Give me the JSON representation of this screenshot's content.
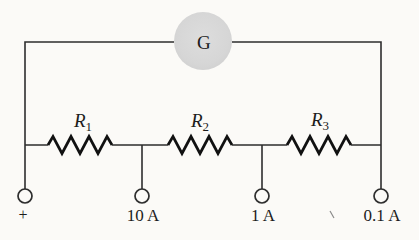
{
  "diagram": {
    "type": "circuit-diagram"
  },
  "colors": {
    "background": "#fbfaf7",
    "wire": "#2e2e2e",
    "resistor_stroke": "#111111",
    "galvanometer_fill": "#d7d7d7",
    "text": "#1c1c1c"
  },
  "galvanometer": {
    "label": "G"
  },
  "resistors": [
    {
      "name": "R1",
      "label": "R",
      "sub": "1"
    },
    {
      "name": "R2",
      "label": "R",
      "sub": "2"
    },
    {
      "name": "R3",
      "label": "R",
      "sub": "3"
    }
  ],
  "terminals": [
    {
      "name": "positive",
      "label": "+"
    },
    {
      "name": "10A",
      "label": "10 A"
    },
    {
      "name": "1A",
      "label": "1 A"
    },
    {
      "name": "0.1A",
      "label": "0.1 A"
    }
  ]
}
